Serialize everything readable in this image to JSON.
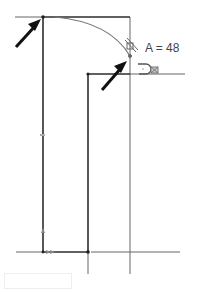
{
  "sketch": {
    "dimension_label": "A = 48",
    "colors": {
      "sketch_line": "#333333",
      "construction_line": "#555555",
      "arc": "#666666",
      "arrow": "#111111",
      "constraint_glyph": "#666666"
    },
    "icons": [
      "arrow-annotation-icon",
      "tangent-constraint-icon",
      "coincident-constraint-icon",
      "fix-constraint-icon"
    ]
  },
  "input": {
    "value": ""
  }
}
